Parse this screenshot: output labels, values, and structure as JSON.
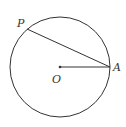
{
  "figure": {
    "type": "circle-geometry",
    "circle": {
      "center_label": "O",
      "cx": 60,
      "cy": 67,
      "r": 50
    },
    "points": [
      {
        "label": "P",
        "x": 27,
        "y": 29,
        "label_x": 17,
        "label_y": 27
      },
      {
        "label": "O",
        "x": 60,
        "y": 67,
        "label_x": 52,
        "label_y": 83
      },
      {
        "label": "A",
        "x": 110,
        "y": 67,
        "label_x": 113,
        "label_y": 71
      }
    ],
    "segments": [
      {
        "from": "P",
        "to": "A"
      },
      {
        "from": "O",
        "to": "A"
      }
    ],
    "stroke_color": "#333333"
  }
}
